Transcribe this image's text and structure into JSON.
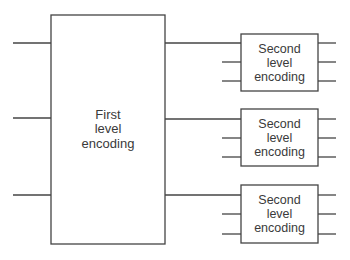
{
  "diagram": {
    "type": "block-diagram",
    "colors": {
      "stroke": "#444444",
      "text": "#3a3a3a",
      "background": "#ffffff"
    },
    "first_level": {
      "label_lines": [
        "First",
        "level",
        "encoding"
      ],
      "inputs": 3,
      "outputs": 3
    },
    "second_level": [
      {
        "label_lines": [
          "Second",
          "level",
          "encoding"
        ],
        "inputs": 3,
        "outputs": 3
      },
      {
        "label_lines": [
          "Second",
          "level",
          "encoding"
        ],
        "inputs": 3,
        "outputs": 3
      },
      {
        "label_lines": [
          "Second",
          "level",
          "encoding"
        ],
        "inputs": 3,
        "outputs": 3
      }
    ]
  }
}
